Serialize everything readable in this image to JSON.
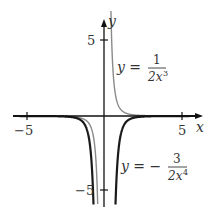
{
  "chart_data": {
    "type": "line",
    "title": "",
    "xlabel": "x",
    "ylabel": "y",
    "xlim": [
      -5.8,
      6.3
    ],
    "ylim": [
      -6.1,
      6.2
    ],
    "grid": false,
    "x_ticks": [
      {
        "value": -5,
        "label": "−5"
      },
      {
        "value": 5,
        "label": "5"
      }
    ],
    "y_ticks": [
      {
        "value": 5,
        "label": "5"
      },
      {
        "value": -5,
        "label": "−5"
      }
    ],
    "series": [
      {
        "name": "y = 1/(2x^3)",
        "formula": "1/(2*x^3)",
        "color": "#8a8a8a",
        "width": 1.4,
        "label": {
          "lhs": "y =",
          "num": "1",
          "den": "2x",
          "exp": "3"
        },
        "sample_points": [
          [
            -2,
            -0.0625
          ],
          [
            -1,
            -0.5
          ],
          [
            -0.5,
            -4
          ],
          [
            0.5,
            4
          ],
          [
            1,
            0.5
          ],
          [
            2,
            0.0625
          ]
        ]
      },
      {
        "name": "y = -3/(2x^4)",
        "formula": "-3/(2*x^4)",
        "color": "#1a1a1a",
        "width": 2.2,
        "label": {
          "lhs": "y = −",
          "num": "3",
          "den": "2x",
          "exp": "4"
        },
        "sample_points": [
          [
            -2,
            -0.09375
          ],
          [
            -1,
            -1.5
          ],
          [
            -0.75,
            -4.74
          ],
          [
            0.75,
            -4.74
          ],
          [
            1,
            -1.5
          ],
          [
            2,
            -0.09375
          ]
        ]
      }
    ]
  }
}
